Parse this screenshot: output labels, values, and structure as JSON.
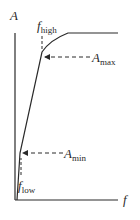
{
  "diagram": {
    "type": "amplitude-vs-frequency curve",
    "axes": {
      "y_label": "A",
      "x_label": "f"
    },
    "annotations": {
      "f_high": {
        "main": "f",
        "sub": "high"
      },
      "f_low": {
        "main": "f",
        "sub": "low"
      },
      "A_max": {
        "main": "A",
        "sub": "max"
      },
      "A_min": {
        "main": "A",
        "sub": "min"
      }
    },
    "colors": {
      "line": "#2a2a2a",
      "background": "#ffffff"
    }
  }
}
